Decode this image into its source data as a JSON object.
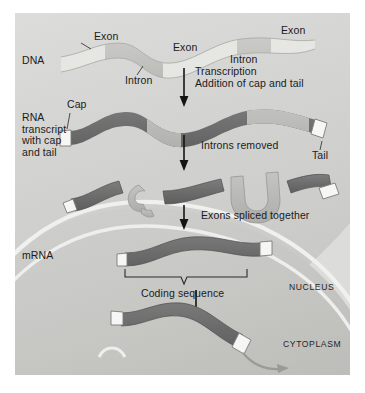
{
  "figure": {
    "domain": "biology-diagram",
    "title_visible": false,
    "background_color": "#d3d3d1",
    "panel": {
      "x": 15,
      "y": 13,
      "width": 335,
      "height": 362
    }
  },
  "colors": {
    "panel_bg": "#d3d3d1",
    "nucleus_bg": "#c9c9c7",
    "cytoplasm_bg": "#dededc",
    "membrane": "#f1f1ef",
    "dna_strand": "#c2c2bf",
    "dna_exon": "#e4e4e1",
    "exon_dark": "#6e6e6e",
    "intron_light": "#b9b9b5",
    "cap_tail_white": "#f6f6f4",
    "text": "#1b1b1b",
    "arrow": "#141414",
    "export_arrow": "#9a9a97"
  },
  "stage_labels": {
    "dna": "DNA",
    "rna_transcript": "RNA\ntranscript\nwith cap\nand tail",
    "mrna": "mRNA"
  },
  "dna_labels": [
    {
      "text": "Exon",
      "x": 79,
      "y": 23
    },
    {
      "text": "Exon",
      "x": 158,
      "y": 30
    },
    {
      "text": "Exon",
      "x": 267,
      "y": 17
    },
    {
      "text": "Intron",
      "x": 117,
      "y": 57
    },
    {
      "text": "Intron",
      "x": 222,
      "y": 43
    }
  ],
  "rna_labels": [
    {
      "text": "Cap",
      "x": 67,
      "y": 88
    },
    {
      "text": "Tail",
      "x": 305,
      "y": 133
    }
  ],
  "process_steps": [
    {
      "id": "transcription",
      "lines": [
        "Transcription",
        "Addition of cap and tail"
      ],
      "x": 196,
      "y": 58,
      "arrow_x": 184,
      "arrow_top": 57,
      "arrow_bottom": 85
    },
    {
      "id": "splicing-removal",
      "lines": [
        "Introns removed"
      ],
      "x": 202,
      "y": 129,
      "arrow_x": 184,
      "arrow_top": 124,
      "arrow_bottom": 152
    },
    {
      "id": "exons-spliced",
      "lines": [
        "Exons spliced together"
      ],
      "x": 202,
      "y": 200,
      "arrow_x": 184,
      "arrow_top": 192,
      "arrow_bottom": 214
    },
    {
      "id": "export",
      "lines": [],
      "x": 0,
      "y": 0,
      "arrow_x": 196,
      "arrow_top": 277,
      "arrow_bottom": 308
    }
  ],
  "bracket_label": "Coding sequence",
  "compartments": {
    "nucleus": "NUCLEUS",
    "cytoplasm": "CYTOPLASM"
  },
  "molecule_segments": {
    "dna_exons": 3,
    "dna_introns": 2,
    "transcript_exons": 3,
    "transcript_introns": 2,
    "excised_introns": 2,
    "mrna_exons": 3
  }
}
